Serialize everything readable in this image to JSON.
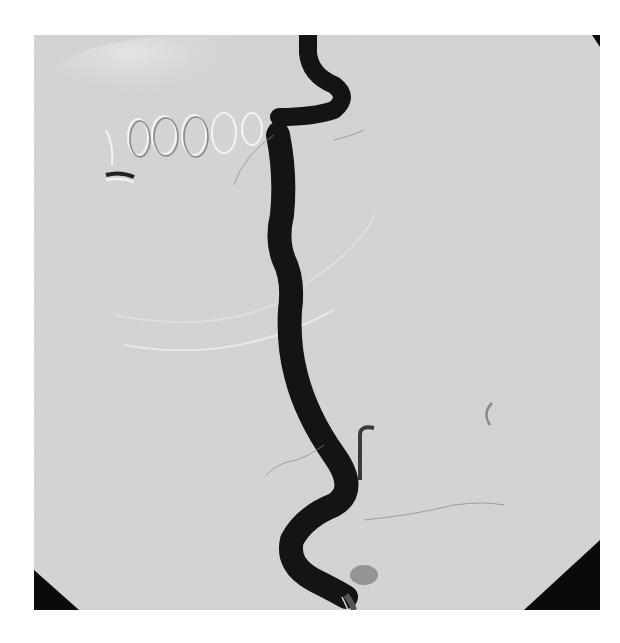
{
  "image": {
    "type": "angiogram",
    "description": "Grayscale digital subtraction angiography showing a tortuous contrast-filled artery running vertically with a loop near the bottom and a kink near the top",
    "colors": {
      "background": "#d4d4d4",
      "vessel": "#141414",
      "corner_mask": "#0a0a0a",
      "page": "#ffffff"
    }
  }
}
